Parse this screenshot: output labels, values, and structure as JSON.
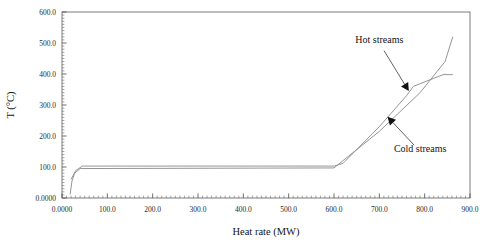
{
  "chart_data": {
    "type": "line",
    "title": "",
    "xlabel": "Heat rate (MW)",
    "ylabel": "T (°C)",
    "xlim": [
      0,
      900
    ],
    "ylim": [
      0,
      600
    ],
    "grid": false,
    "legend_position": "annotations-inline",
    "xticks": [
      0,
      100,
      200,
      300,
      400,
      500,
      600,
      700,
      800,
      900
    ],
    "xtick_labels": [
      "0.0000",
      "100.0",
      "200.0",
      "300.0",
      "400.0",
      "500.0",
      "600.0",
      "700.0",
      "800.0",
      "900.0"
    ],
    "yticks": [
      0,
      100,
      200,
      300,
      400,
      500,
      600
    ],
    "ytick_labels": [
      "0.0000",
      "100.0",
      "200.0",
      "300.0",
      "400.0",
      "500.0",
      "600.0"
    ],
    "series": [
      {
        "name": "Hot streams",
        "x": [
          20,
          30,
          45,
          600,
          620,
          700,
          760,
          775,
          830,
          845,
          845,
          862
        ],
        "y": [
          60,
          88,
          103,
          103,
          112,
          230,
          330,
          360,
          392,
          400,
          398,
          398
        ]
      },
      {
        "name": "Cold streams",
        "x": [
          18,
          22,
          28,
          40,
          600,
          700,
          790,
          845,
          862
        ],
        "y": [
          12,
          55,
          80,
          95,
          97,
          215,
          340,
          440,
          520
        ]
      }
    ],
    "annotations": [
      {
        "label": "Hot streams",
        "text_x": 700,
        "text_y": 500,
        "point_x": 765,
        "point_y": 345
      },
      {
        "label": "Cold streams",
        "text_x": 790,
        "text_y": 150,
        "point_x": 718,
        "point_y": 262
      }
    ]
  }
}
